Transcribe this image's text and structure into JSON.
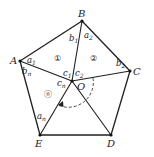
{
  "diagram": {
    "colors": {
      "line": "#1f1f1f",
      "background": "#ffffff"
    },
    "vertices": [
      {
        "id": "A",
        "label": "A",
        "x": 20,
        "y": 61
      },
      {
        "id": "B",
        "label": "B",
        "x": 82,
        "y": 21
      },
      {
        "id": "C",
        "label": "C",
        "x": 130,
        "y": 71
      },
      {
        "id": "D",
        "label": "D",
        "x": 111,
        "y": 135
      },
      {
        "id": "E",
        "label": "E",
        "x": 40,
        "y": 135
      }
    ],
    "center": {
      "id": "O",
      "label": "O",
      "x": 72,
      "y": 81
    },
    "regions": [
      {
        "id": "1",
        "label": "①"
      },
      {
        "id": "2",
        "label": "②"
      },
      {
        "id": "n",
        "label": "ⓝ"
      }
    ],
    "angle_labels": {
      "a1": {
        "base": "a",
        "sub": "1"
      },
      "b1": {
        "base": "b",
        "sub": "1"
      },
      "a2": {
        "base": "a",
        "sub": "2"
      },
      "b2": {
        "base": "b",
        "sub": "2"
      },
      "c1": {
        "base": "c",
        "sub": "1"
      },
      "c2": {
        "base": "c",
        "sub": "2"
      },
      "cn": {
        "base": "c",
        "sub": "n"
      },
      "bn": {
        "base": "b",
        "sub": "n"
      },
      "an": {
        "base": "a",
        "sub": "n"
      }
    }
  }
}
